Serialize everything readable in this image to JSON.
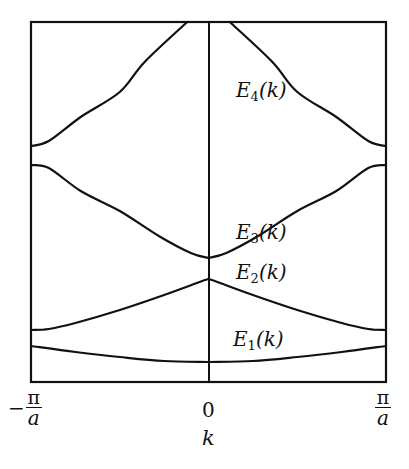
{
  "figure": {
    "type": "band structure diagram (nearly-free-electron energy bands in reduced zone)",
    "line_color": "#111111",
    "background": "#ffffff"
  },
  "axes": {
    "xlabel": "k",
    "ylabel": "",
    "x_ticks": [
      {
        "label": "-π/a",
        "sign": "−",
        "num": "π",
        "den": "a",
        "pos": "left"
      },
      {
        "label": "0",
        "text": "0",
        "pos": "center"
      },
      {
        "label": "π/a",
        "num": "π",
        "den": "a",
        "pos": "right"
      }
    ],
    "xlim": [
      "-π/a",
      "π/a"
    ],
    "center_line": "k = 0"
  },
  "bands": [
    {
      "name": "E1",
      "label_main": "E",
      "label_sub": "1",
      "label_arg": "(k)",
      "points": [
        [
          -1,
          346
        ],
        [
          -0.75,
          352
        ],
        [
          -0.5,
          357
        ],
        [
          -0.25,
          361
        ],
        [
          0,
          362
        ],
        [
          0.25,
          361
        ],
        [
          0.5,
          357
        ],
        [
          0.75,
          352
        ],
        [
          1,
          346
        ]
      ]
    },
    {
      "name": "E2",
      "label_main": "E",
      "label_sub": "2",
      "label_arg": "(k)",
      "points": [
        [
          -1,
          330
        ],
        [
          -0.9,
          329
        ],
        [
          -0.75,
          323
        ],
        [
          -0.5,
          310
        ],
        [
          -0.25,
          295
        ],
        [
          -0.05,
          282
        ],
        [
          0,
          279
        ],
        [
          0.05,
          282
        ],
        [
          0.25,
          295
        ],
        [
          0.5,
          310
        ],
        [
          0.75,
          323
        ],
        [
          0.9,
          329
        ],
        [
          1,
          330
        ]
      ]
    },
    {
      "name": "E3",
      "label_main": "E",
      "label_sub": "3",
      "label_arg": "(k)",
      "points": [
        [
          -1,
          165
        ],
        [
          -0.9,
          168
        ],
        [
          -0.72,
          191
        ],
        [
          -0.5,
          211
        ],
        [
          -0.28,
          236
        ],
        [
          -0.1,
          253
        ],
        [
          0,
          258
        ],
        [
          0.1,
          253
        ],
        [
          0.28,
          236
        ],
        [
          0.5,
          211
        ],
        [
          0.72,
          191
        ],
        [
          0.9,
          168
        ],
        [
          1,
          165
        ]
      ]
    },
    {
      "name": "E4",
      "label_main": "E",
      "label_sub": "4",
      "label_arg": "(k)",
      "points": [
        [
          -1,
          146
        ],
        [
          -0.9,
          141
        ],
        [
          -0.72,
          117
        ],
        [
          -0.5,
          92
        ],
        [
          -0.36,
          62
        ],
        [
          -0.12,
          22
        ],
        [
          0.12,
          22
        ],
        [
          0.36,
          62
        ],
        [
          0.5,
          92
        ],
        [
          0.72,
          117
        ],
        [
          0.9,
          141
        ],
        [
          1,
          146
        ]
      ]
    }
  ],
  "labels": {
    "E4": {
      "x": 236,
      "y": 80
    },
    "E3": {
      "x": 236,
      "y": 222
    },
    "E2": {
      "x": 236,
      "y": 262
    },
    "E1": {
      "x": 233,
      "y": 329
    }
  },
  "chart_data": {
    "type": "line",
    "title": "",
    "xlabel": "k",
    "ylabel": "E",
    "x_tick_labels": [
      "-π/a",
      "0",
      "π/a"
    ],
    "x_range": [
      -1,
      1
    ],
    "x_units": "π/a",
    "y_units": "arbitrary (relative energy, 0 = bottom of frame, 1 = top)",
    "grid": false,
    "legend": "inline labels E1(k)…E4(k)",
    "series": [
      {
        "name": "E1(k)",
        "x": [
          -1,
          -0.5,
          0,
          0.5,
          1
        ],
        "y": [
          0.1,
          0.07,
          0.06,
          0.07,
          0.1
        ]
      },
      {
        "name": "E2(k)",
        "x": [
          -1,
          -0.5,
          0,
          0.5,
          1
        ],
        "y": [
          0.14,
          0.2,
          0.29,
          0.2,
          0.14
        ]
      },
      {
        "name": "E3(k)",
        "x": [
          -1,
          -0.5,
          0,
          0.5,
          1
        ],
        "y": [
          0.6,
          0.48,
          0.35,
          0.48,
          0.6
        ]
      },
      {
        "name": "E4(k)",
        "x": [
          -1,
          -0.5,
          -0.12,
          0.12,
          0.5,
          1
        ],
        "y": [
          0.65,
          0.8,
          1.0,
          1.0,
          0.8,
          0.65
        ]
      }
    ]
  }
}
